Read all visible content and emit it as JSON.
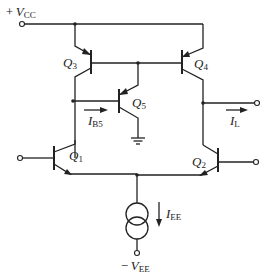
{
  "diagram": {
    "type": "circuit-schematic",
    "supplies": {
      "positive": {
        "sign": "+",
        "symbol": "V",
        "subscript": "CC"
      },
      "negative": {
        "sign": "−",
        "symbol": "V",
        "subscript": "EE"
      }
    },
    "transistors": [
      {
        "id": "Q1",
        "symbol": "Q",
        "subscript": "1",
        "type": "npn"
      },
      {
        "id": "Q2",
        "symbol": "Q",
        "subscript": "2",
        "type": "npn"
      },
      {
        "id": "Q3",
        "symbol": "Q",
        "subscript": "3",
        "type": "pnp"
      },
      {
        "id": "Q4",
        "symbol": "Q",
        "subscript": "4",
        "type": "pnp"
      },
      {
        "id": "Q5",
        "symbol": "Q",
        "subscript": "5",
        "type": "pnp"
      }
    ],
    "currents": {
      "ib5": {
        "symbol": "I",
        "subscript": "B5"
      },
      "il": {
        "symbol": "I",
        "subscript": "L"
      },
      "iee": {
        "symbol": "I",
        "subscript": "EE"
      }
    },
    "colors": {
      "ink": "#222222",
      "background": "#ffffff"
    }
  }
}
